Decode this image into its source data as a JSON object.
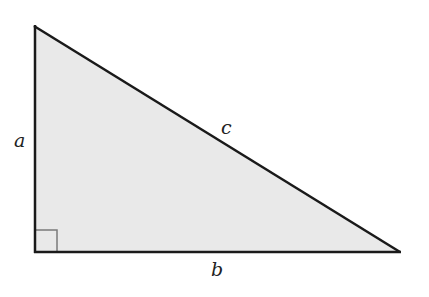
{
  "diagram": {
    "type": "right-triangle",
    "fill_color": "#e9e9e9",
    "stroke_color": "#1a1a1a",
    "vertices": {
      "top": [
        34,
        25
      ],
      "right_angle": [
        35,
        252
      ],
      "right": [
        400,
        252
      ]
    },
    "labels": {
      "a": "a",
      "b": "b",
      "c": "c"
    },
    "right_angle_marker": true
  }
}
